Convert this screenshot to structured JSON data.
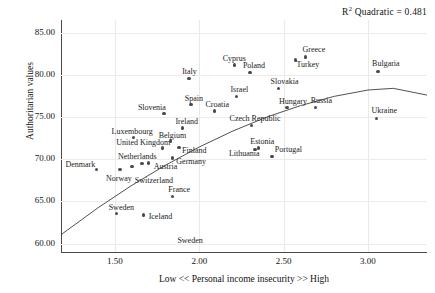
{
  "annotation": {
    "r2_prefix": "R",
    "r2_sup": "2",
    "r2_text": " Quadratic = 0.481"
  },
  "chart_data": {
    "type": "scatter",
    "title": "",
    "xlabel": "Low << Personal income insecurity >> High",
    "ylabel": "Authoritarian values",
    "xlim": [
      1.18,
      3.35
    ],
    "ylim": [
      59.0,
      86.5
    ],
    "xticks": [
      "1.50",
      "2.00",
      "2.50",
      "3.00"
    ],
    "xtick_values": [
      1.5,
      2.0,
      2.5,
      3.0
    ],
    "yticks": [
      "60.00",
      "65.00",
      "70.00",
      "75.00",
      "80.00",
      "85.00"
    ],
    "ytick_values": [
      60,
      65,
      70,
      75,
      80,
      85
    ],
    "grid": true,
    "legend": "none",
    "fit": {
      "type": "quadratic",
      "r_squared": 0.481,
      "label": "R2 Quadratic = 0.481"
    },
    "points": [
      {
        "label": "Denmark",
        "x": 1.39,
        "y": 68.8,
        "lx": -31,
        "ly": -4
      },
      {
        "label": "Norway",
        "x": 1.53,
        "y": 68.8,
        "lx": -14,
        "ly": 10
      },
      {
        "label": "Switzerland",
        "x": 1.6,
        "y": 69.1,
        "lx": 3,
        "ly": 14
      },
      {
        "label": "Netherlands",
        "x": 1.66,
        "y": 69.5,
        "lx": -24,
        "ly": -6
      },
      {
        "label": "Austria",
        "x": 1.7,
        "y": 69.55,
        "lx": 5,
        "ly": 4
      },
      {
        "label": "Luxembourg",
        "x": 1.61,
        "y": 72.55,
        "lx": -22,
        "ly": -6
      },
      {
        "label": "United Kingdom",
        "x": 1.78,
        "y": 71.35,
        "lx": -46,
        "ly": -5
      },
      {
        "label": "Belgium",
        "x": 1.83,
        "y": 72.15,
        "lx": -12,
        "ly": -5
      },
      {
        "label": "Finland",
        "x": 1.88,
        "y": 71.4,
        "lx": 3,
        "ly": 4
      },
      {
        "label": "Germany",
        "x": 1.84,
        "y": 70.15,
        "lx": 4,
        "ly": 4
      },
      {
        "label": "Sweden",
        "x": 1.51,
        "y": 63.55,
        "lx": -8,
        "ly": -6
      },
      {
        "label": "Iceland",
        "x": 1.67,
        "y": 63.4,
        "lx": 5,
        "ly": 2
      },
      {
        "label": "France",
        "x": 1.84,
        "y": 65.55,
        "lx": -4,
        "ly": -7
      },
      {
        "label": "Ireland",
        "x": 1.9,
        "y": 73.7,
        "lx": -7,
        "ly": -6
      },
      {
        "label": "Slovenia",
        "x": 1.79,
        "y": 75.45,
        "lx": -26,
        "ly": -5
      },
      {
        "label": "Spain",
        "x": 1.95,
        "y": 76.45,
        "lx": -6,
        "ly": -6
      },
      {
        "label": "Italy",
        "x": 1.94,
        "y": 79.55,
        "lx": -7,
        "ly": -7
      },
      {
        "label": "Croatia",
        "x": 2.09,
        "y": 75.7,
        "lx": -9,
        "ly": -6
      },
      {
        "label": "Cyprus",
        "x": 2.21,
        "y": 81.15,
        "lx": -12,
        "ly": -6
      },
      {
        "label": "Israel",
        "x": 2.22,
        "y": 77.45,
        "lx": -6,
        "ly": -6
      },
      {
        "label": "Poland",
        "x": 2.3,
        "y": 80.25,
        "lx": -7,
        "ly": -7
      },
      {
        "label": "Czech Republic",
        "x": 2.31,
        "y": 74.0,
        "lx": -22,
        "ly": -6
      },
      {
        "label": "Estonia",
        "x": 2.35,
        "y": 71.35,
        "lx": -8,
        "ly": -6
      },
      {
        "label": "Lithuania",
        "x": 2.33,
        "y": 71.15,
        "lx": -26,
        "ly": 5
      },
      {
        "label": "Portugal",
        "x": 2.43,
        "y": 70.35,
        "lx": 3,
        "ly": -6
      },
      {
        "label": "Slovakia",
        "x": 2.47,
        "y": 78.35,
        "lx": -8,
        "ly": -7
      },
      {
        "label": "Hungary",
        "x": 2.52,
        "y": 76.1,
        "lx": -8,
        "ly": -6
      },
      {
        "label": "Turkey",
        "x": 2.57,
        "y": 81.75,
        "lx": 1,
        "ly": 5
      },
      {
        "label": "Greece",
        "x": 2.63,
        "y": 82.1,
        "lx": -3,
        "ly": -7
      },
      {
        "label": "Russia",
        "x": 2.69,
        "y": 76.1,
        "lx": -5,
        "ly": -7
      },
      {
        "label": "Bulgaria",
        "x": 3.06,
        "y": 80.4,
        "lx": -6,
        "ly": -7
      },
      {
        "label": "Ukraine",
        "x": 3.05,
        "y": 74.85,
        "lx": -5,
        "ly": -7
      }
    ],
    "unmarked_labels": [
      {
        "label": "Sweden",
        "x": 1.87,
        "y": 60.3
      }
    ],
    "fit_curve_points": [
      {
        "x": 1.18,
        "y": 61.05
      },
      {
        "x": 1.4,
        "y": 64.25
      },
      {
        "x": 1.6,
        "y": 66.9
      },
      {
        "x": 1.8,
        "y": 69.3
      },
      {
        "x": 2.0,
        "y": 71.45
      },
      {
        "x": 2.2,
        "y": 73.35
      },
      {
        "x": 2.4,
        "y": 75.0
      },
      {
        "x": 2.6,
        "y": 76.35
      },
      {
        "x": 2.8,
        "y": 77.45
      },
      {
        "x": 3.0,
        "y": 78.2
      },
      {
        "x": 3.15,
        "y": 78.4
      },
      {
        "x": 3.35,
        "y": 77.6
      }
    ]
  }
}
